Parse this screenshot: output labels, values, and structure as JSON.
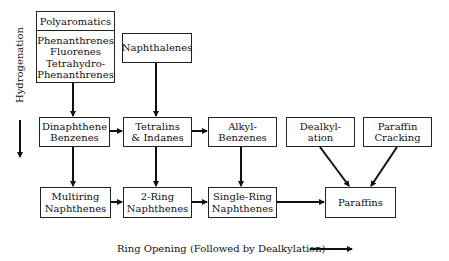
{
  "diagram": {
    "polyaromatics": {
      "title": "Polyaromatics",
      "items": [
        "Phenanthrenes",
        "Fluorenes",
        "Tetrahydro-",
        "Phenanthrenes"
      ]
    },
    "nodes": {
      "naphthalenes": [
        "Naphthalenes"
      ],
      "dinaphthene_benzenes": [
        "Dinaphthene",
        "Benzenes"
      ],
      "tetralins_indanes": [
        "Tetralins",
        "& Indanes"
      ],
      "alkyl_benzenes": [
        "Alkyl-",
        "Benzenes"
      ],
      "dealkylation": [
        "Dealkyl-",
        "ation"
      ],
      "paraffin_cracking": [
        "Paraffin",
        "Cracking"
      ],
      "multiring_naphthenes": [
        "Multiring",
        "Naphthenes"
      ],
      "two_ring_naphthenes": [
        "2-Ring",
        "Naphthenes"
      ],
      "single_ring_naphthenes": [
        "Single-Ring",
        "Naphthenes"
      ],
      "paraffins": [
        "Paraffins"
      ]
    },
    "axis_labels": {
      "vertical": "Hydrogenation",
      "horizontal": "Ring Opening (Followed by Dealkylation)"
    },
    "edges": [
      {
        "from": "Polyaromatics",
        "to": "Dinaphthene Benzenes"
      },
      {
        "from": "Naphthalenes",
        "to": "Tetralins & Indanes"
      },
      {
        "from": "Dinaphthene Benzenes",
        "to": "Tetralins & Indanes"
      },
      {
        "from": "Tetralins & Indanes",
        "to": "Alkyl-Benzenes"
      },
      {
        "from": "Dinaphthene Benzenes",
        "to": "Multiring Naphthenes"
      },
      {
        "from": "Tetralins & Indanes",
        "to": "2-Ring Naphthenes"
      },
      {
        "from": "Alkyl-Benzenes",
        "to": "Single-Ring Naphthenes"
      },
      {
        "from": "Multiring Naphthenes",
        "to": "2-Ring Naphthenes"
      },
      {
        "from": "2-Ring Naphthenes",
        "to": "Single-Ring Naphthenes"
      },
      {
        "from": "Single-Ring Naphthenes",
        "to": "Paraffins"
      },
      {
        "from": "Dealkylation",
        "to": "Paraffins"
      },
      {
        "from": "Paraffin Cracking",
        "to": "Paraffins"
      }
    ]
  }
}
